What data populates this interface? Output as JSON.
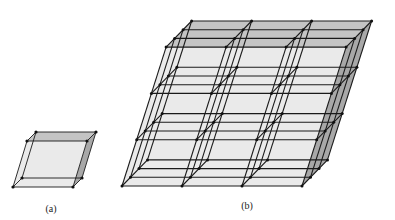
{
  "figure": {
    "background": "#ffffff",
    "line_color": "#1a1a1a",
    "vertex_color": "#111111",
    "face_front": "#e6e6e6",
    "face_top": "#c4c4c4",
    "face_side": "#a8a8a8"
  },
  "panels": [
    {
      "id": "a",
      "label": "(a)",
      "label_pos": [
        51,
        203
      ],
      "origin": [
        13,
        187
      ],
      "cell_width": 60,
      "cell_height": 46,
      "slant": 14,
      "depth": [
        9,
        -9
      ],
      "nx": 1,
      "ny": 1,
      "nz": 1
    },
    {
      "id": "b",
      "label": "(b)",
      "label_pos": [
        247,
        200
      ],
      "origin": [
        122,
        186
      ],
      "cell_width": 60,
      "cell_height": 46.3,
      "slant": 14.7,
      "depth": [
        8.5,
        -8.7
      ],
      "nx": 3,
      "ny": 3,
      "nz": 3
    }
  ]
}
